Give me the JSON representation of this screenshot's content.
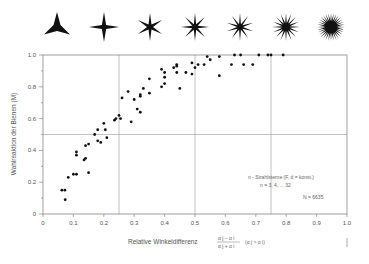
{
  "chart_data": {
    "type": "scatter",
    "title": "",
    "header_icons": {
      "description": "n-ray star stimuli",
      "ray_counts": [
        3,
        4,
        6,
        8,
        10,
        16,
        32
      ]
    },
    "xlabel": "Relative  Winkeldifferenz",
    "xlabel_fraction_num": "α j − α i",
    "xlabel_fraction_den": "α j + α i",
    "xlabel_suffix": "(α j > α i)",
    "ylabel": "Wahlreaktion  der  Bienen  (M)",
    "xlim": [
      0,
      1.0
    ],
    "ylim": [
      0,
      1.0
    ],
    "xticks": [
      "0",
      "0.1",
      "0.2",
      "0.3",
      "0.4",
      "0.5",
      "0.6",
      "0.7",
      "0.8",
      "0.9",
      "1.0"
    ],
    "yticks": [
      "0",
      "0.2",
      "0.4",
      "0.6",
      "0.8",
      "1.0"
    ],
    "reference_lines": {
      "vertical": [
        0.25,
        0.5,
        0.75
      ],
      "horizontal": [
        0.5
      ]
    },
    "annotation": {
      "line1": "n - Strahlsterne (F, d = konst.)",
      "line2": "n = 3, 4, ...  32",
      "line3": "N = 6635"
    },
    "points": [
      [
        0.062,
        0.15
      ],
      [
        0.072,
        0.15
      ],
      [
        0.073,
        0.09
      ],
      [
        0.083,
        0.23
      ],
      [
        0.1,
        0.25
      ],
      [
        0.11,
        0.25
      ],
      [
        0.11,
        0.39
      ],
      [
        0.11,
        0.37
      ],
      [
        0.135,
        0.34
      ],
      [
        0.14,
        0.35
      ],
      [
        0.14,
        0.43
      ],
      [
        0.15,
        0.44
      ],
      [
        0.15,
        0.26
      ],
      [
        0.17,
        0.5
      ],
      [
        0.18,
        0.46
      ],
      [
        0.18,
        0.53
      ],
      [
        0.19,
        0.45
      ],
      [
        0.2,
        0.57
      ],
      [
        0.205,
        0.53
      ],
      [
        0.21,
        0.48
      ],
      [
        0.235,
        0.59
      ],
      [
        0.24,
        0.6
      ],
      [
        0.25,
        0.62
      ],
      [
        0.255,
        0.6
      ],
      [
        0.26,
        0.73
      ],
      [
        0.28,
        0.77
      ],
      [
        0.29,
        0.58
      ],
      [
        0.3,
        0.72
      ],
      [
        0.31,
        0.66
      ],
      [
        0.32,
        0.64
      ],
      [
        0.32,
        0.74
      ],
      [
        0.32,
        0.75
      ],
      [
        0.33,
        0.79
      ],
      [
        0.35,
        0.85
      ],
      [
        0.35,
        0.76
      ],
      [
        0.39,
        0.91
      ],
      [
        0.4,
        0.89
      ],
      [
        0.4,
        0.86
      ],
      [
        0.4,
        0.82
      ],
      [
        0.39,
        0.8
      ],
      [
        0.43,
        0.92
      ],
      [
        0.44,
        0.94
      ],
      [
        0.44,
        0.93
      ],
      [
        0.44,
        0.89
      ],
      [
        0.45,
        0.79
      ],
      [
        0.47,
        0.89
      ],
      [
        0.49,
        0.95
      ],
      [
        0.49,
        0.88
      ],
      [
        0.5,
        0.92
      ],
      [
        0.51,
        0.94
      ],
      [
        0.53,
        0.94
      ],
      [
        0.54,
        0.99
      ],
      [
        0.55,
        0.97
      ],
      [
        0.58,
        0.99
      ],
      [
        0.58,
        0.87
      ],
      [
        0.62,
        0.94
      ],
      [
        0.63,
        1.0
      ],
      [
        0.65,
        1.0
      ],
      [
        0.66,
        0.94
      ],
      [
        0.69,
        0.94
      ],
      [
        0.71,
        1.0
      ],
      [
        0.74,
        1.0
      ],
      [
        0.75,
        1.0
      ],
      [
        0.79,
        1.0
      ]
    ]
  }
}
